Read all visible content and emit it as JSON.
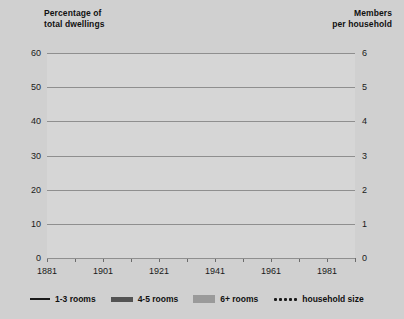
{
  "axes": {
    "left_title": "Percentage of\ntotal dwellings",
    "right_title": "Members\nper household",
    "left_ticks": [
      "60",
      "50",
      "40",
      "30",
      "20",
      "10",
      "0"
    ],
    "right_ticks": [
      "6",
      "5",
      "4",
      "3",
      "2",
      "1",
      "0"
    ],
    "x_ticks": [
      "1881",
      "1901",
      "1921",
      "1941",
      "1961",
      "1981"
    ]
  },
  "legend": {
    "items": [
      {
        "label": "1-3 rooms",
        "swatch": "thin-line-swatch"
      },
      {
        "label": "4-5 rooms",
        "swatch": "thick-line-swatch"
      },
      {
        "label": "6+ rooms",
        "swatch": "gray-band-swatch"
      },
      {
        "label": "household size",
        "swatch": "dotted-line-swatch"
      }
    ]
  },
  "colors": {
    "background": "#d0d0d0",
    "plot_background": "#d6d6d6",
    "gridline": "#8f8f8f",
    "rooms_1_3": "#1a1a1a",
    "rooms_4_5": "#535353",
    "rooms_6plus": "#9a9a9a",
    "household_size": "#1a1a1a"
  },
  "chart_data": {
    "type": "line",
    "title": "",
    "xlabel": "",
    "ylabel": "Percentage of total dwellings",
    "y2label": "Members per household",
    "xlim": [
      1881,
      1991
    ],
    "ylim": [
      0,
      60
    ],
    "y2lim": [
      0,
      6
    ],
    "grid": true,
    "legend_position": "bottom",
    "x": [
      1881,
      1891,
      1901,
      1911,
      1921,
      1931,
      1941,
      1951,
      1961,
      1971,
      1981,
      1991
    ],
    "series": [
      {
        "name": "1-3 rooms",
        "axis": "left",
        "style": "thin solid line",
        "x": [
          1911,
          1921,
          1931,
          1941,
          1951,
          1961,
          1971,
          1981,
          1991
        ],
        "values": [
          19.5,
          18.5,
          18.0,
          21.0,
          16.5,
          15.0,
          16.0,
          15.0,
          11.5
        ]
      },
      {
        "name": "4-5 rooms",
        "axis": "left",
        "style": "thick solid line",
        "x": [
          1911,
          1921,
          1931,
          1941,
          1951,
          1961,
          1971,
          1981,
          1991
        ],
        "values": [
          20.5,
          25.0,
          31.5,
          38.0,
          42.0,
          44.5,
          41.0,
          37.0,
          34.0
        ]
      },
      {
        "name": "6+ rooms",
        "axis": "left",
        "style": "thick gray band",
        "x": [
          1911,
          1921,
          1931,
          1941,
          1951,
          1961,
          1971,
          1981,
          1991
        ],
        "values": [
          58.0,
          56.0,
          50.0,
          41.0,
          42.5,
          43.0,
          46.0,
          51.0,
          56.5
        ]
      },
      {
        "name": "household size",
        "axis": "right",
        "style": "dotted line",
        "x": [
          1881,
          1891,
          1901,
          1911,
          1921,
          1931,
          1941,
          1951,
          1961,
          1971,
          1981,
          1991
        ],
        "values": [
          5.2,
          5.15,
          5.0,
          4.7,
          4.4,
          4.25,
          4.2,
          4.15,
          3.8,
          3.3,
          2.9,
          2.65
        ]
      }
    ]
  }
}
